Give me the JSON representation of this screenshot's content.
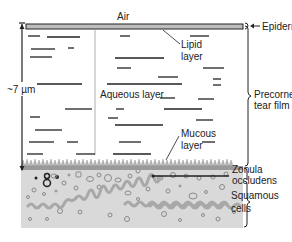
{
  "figure": {
    "type": "anatomical-diagram",
    "labels": {
      "air": "Air",
      "epidermis": "Epidermis",
      "lipid_line1": "Lipid",
      "lipid_line2": "layer",
      "aqueous": "Aqueous layer",
      "thickness": "~7 µm",
      "precorneal_line1": "Precorneal",
      "precorneal_line2": "tear film",
      "mucous_line1": "Mucous",
      "mucous_line2": "layer",
      "zonula_line1": "Zonula",
      "zonula_line2": "occludens",
      "squamous_line1": "Squamous",
      "squamous_line2": "cells"
    },
    "colors": {
      "line": "#222222",
      "lipid_bar": "#bdbdbd",
      "cell_layer": "#d9d9d9",
      "mucin_fringe": "#9a9a9a",
      "cell_wave": "#a8a8a8"
    }
  }
}
